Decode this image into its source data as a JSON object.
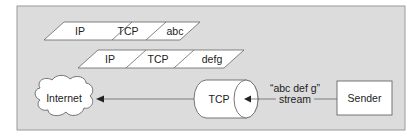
{
  "diagram": {
    "packets": [
      {
        "segments": [
          "IP",
          "TCP",
          "abc"
        ]
      },
      {
        "segments": [
          "IP",
          "TCP",
          "defg"
        ]
      }
    ],
    "nodes": {
      "internet": "Internet",
      "tcp": "TCP",
      "sender": "Sender"
    },
    "stream_label": {
      "line1": "“abc  def  g”",
      "line2": "stream"
    },
    "colors": {
      "panel": "#dcdcdc",
      "panel_border": "#9a9a9a",
      "shape_fill": "#ffffff",
      "stroke": "#555555"
    }
  }
}
